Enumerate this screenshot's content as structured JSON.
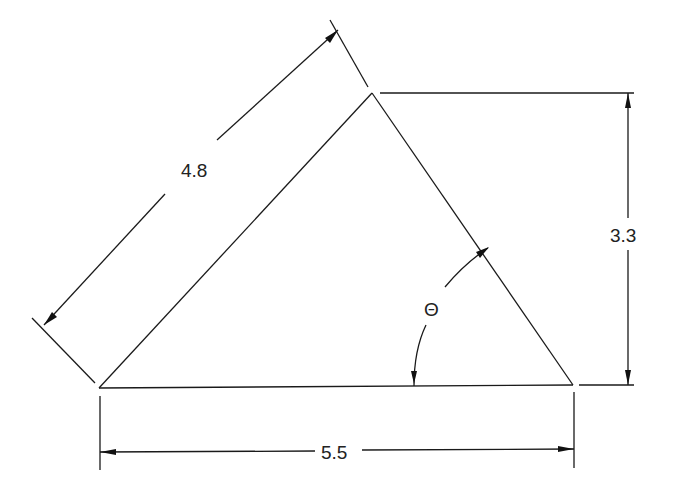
{
  "figure": {
    "type": "triangle-dimension-drawing",
    "dimensions": {
      "hypotenuse_label": "4.8",
      "height_label": "3.3",
      "base_label": "5.5",
      "angle_label": "Θ"
    },
    "colors": {
      "line": "#1a1a1a",
      "background": "#ffffff"
    }
  }
}
